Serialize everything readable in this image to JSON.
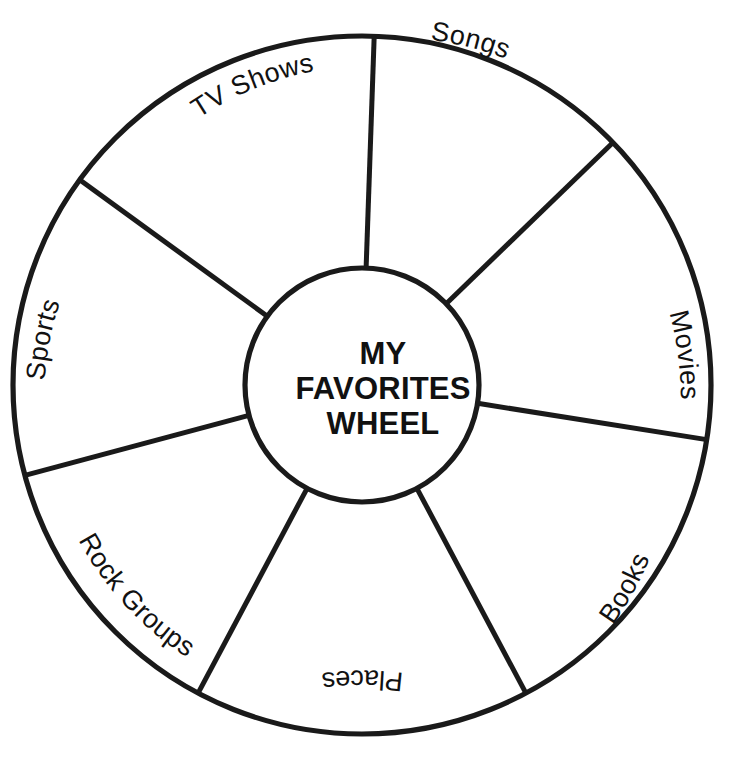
{
  "page": {
    "title": "My Favorites Wheel",
    "background_color": "#ffffff",
    "stroke_color": "#1a1a1a"
  },
  "hub": {
    "name": "wheel-hub",
    "title_lines": [
      "MY",
      "FAVORITES",
      "WHEEL"
    ],
    "line1": "MY",
    "line2": "FAVORITES",
    "line3": "WHEEL"
  },
  "wheel": {
    "center_x": 362,
    "center_y": 385,
    "outer_radius": 349,
    "inner_radius": 117,
    "segment_count": 8,
    "segments": [
      {
        "id": "songs",
        "label": "Songs",
        "start_angle": -88,
        "end_angle": -44
      },
      {
        "id": "movies",
        "label": "Movies",
        "start_angle": -44,
        "end_angle": 9
      },
      {
        "id": "books",
        "label": "Books",
        "start_angle": 9,
        "end_angle": 62
      },
      {
        "id": "places",
        "label": "Places",
        "start_angle": 62,
        "end_angle": 118
      },
      {
        "id": "rock-groups",
        "label": "Rock Groups",
        "start_angle": 118,
        "end_angle": 165
      },
      {
        "id": "sports",
        "label": "Sports",
        "start_angle": 165,
        "end_angle": 216
      },
      {
        "id": "tv-shows",
        "label": "TV Shows",
        "start_angle": 216,
        "end_angle": 272
      }
    ],
    "labels": [
      "Songs",
      "Movies",
      "Books",
      "Places",
      "Rock Groups",
      "Sports",
      "TV Shows"
    ],
    "spoke_angles_deg": [
      -88,
      -44,
      9,
      62,
      118,
      165,
      216,
      272
    ]
  }
}
